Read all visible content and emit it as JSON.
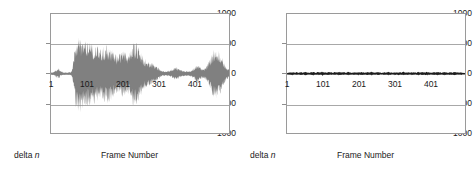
{
  "figure": {
    "background": "#ffffff",
    "waveform_color": "#808080",
    "grid_color": "#a8a8a8",
    "frame_color": "#9a9a9a"
  },
  "chart_data": [
    {
      "type": "area",
      "id": "left-waveform",
      "title": "",
      "xlabel": "Frame Number",
      "ylabel": "delta n",
      "ylabel_prefix": "delta ",
      "ylabel_italic": "n",
      "ylim": [
        -1000,
        1000
      ],
      "xlim": [
        1,
        501
      ],
      "grid": true,
      "legend": "none",
      "yticks": [
        1000,
        500,
        0,
        -500,
        -1000
      ],
      "ytick_labels": [
        "1000",
        "500",
        "0",
        "-500",
        "-1000"
      ],
      "xticks": [
        1,
        101,
        201,
        301,
        401
      ],
      "xtick_labels": [
        "1",
        "101",
        "201",
        "301",
        "401"
      ],
      "description": "Large amplitude delta-n residual signal, envelope peaking near +/-650",
      "envelope_x": [
        1,
        8,
        16,
        22,
        28,
        34,
        40,
        46,
        52,
        58,
        62,
        66,
        70,
        76,
        82,
        88,
        94,
        100,
        106,
        112,
        118,
        124,
        130,
        136,
        142,
        148,
        154,
        160,
        166,
        172,
        178,
        184,
        190,
        196,
        202,
        208,
        214,
        220,
        226,
        232,
        238,
        244,
        250,
        256,
        262,
        268,
        274,
        280,
        286,
        292,
        298,
        304,
        310,
        316,
        322,
        328,
        334,
        340,
        346,
        352,
        358,
        364,
        370,
        376,
        382,
        388,
        394,
        400,
        406,
        412,
        418,
        424,
        430,
        436,
        442,
        448,
        454,
        460,
        466,
        472,
        478,
        484,
        490,
        496,
        501
      ],
      "envelope_upper": [
        20,
        30,
        70,
        95,
        60,
        25,
        20,
        18,
        22,
        30,
        120,
        330,
        520,
        600,
        620,
        570,
        545,
        560,
        530,
        505,
        520,
        500,
        470,
        440,
        430,
        465,
        490,
        510,
        470,
        430,
        380,
        330,
        310,
        360,
        410,
        390,
        350,
        330,
        420,
        520,
        545,
        500,
        420,
        330,
        270,
        230,
        210,
        200,
        185,
        160,
        120,
        90,
        60,
        45,
        40,
        45,
        55,
        70,
        95,
        120,
        100,
        70,
        55,
        45,
        40,
        42,
        55,
        80,
        120,
        155,
        130,
        95,
        80,
        110,
        170,
        260,
        350,
        415,
        430,
        400,
        330,
        240,
        150,
        95,
        60
      ],
      "envelope_lower": [
        -20,
        -28,
        -65,
        -90,
        -55,
        -25,
        -20,
        -18,
        -22,
        -30,
        -130,
        -360,
        -560,
        -640,
        -660,
        -620,
        -590,
        -575,
        -545,
        -520,
        -530,
        -510,
        -480,
        -450,
        -440,
        -480,
        -505,
        -525,
        -490,
        -450,
        -395,
        -345,
        -320,
        -370,
        -420,
        -400,
        -360,
        -340,
        -430,
        -540,
        -565,
        -520,
        -430,
        -340,
        -280,
        -240,
        -215,
        -205,
        -190,
        -165,
        -125,
        -95,
        -62,
        -47,
        -42,
        -47,
        -58,
        -72,
        -98,
        -125,
        -105,
        -72,
        -57,
        -47,
        -42,
        -44,
        -58,
        -84,
        -125,
        -160,
        -135,
        -98,
        -82,
        -115,
        -175,
        -268,
        -360,
        -425,
        -440,
        -410,
        -340,
        -248,
        -155,
        -98,
        -62
      ]
    },
    {
      "type": "area",
      "id": "right-waveform",
      "title": "",
      "xlabel": "Frame Number",
      "ylabel": "delta n",
      "ylabel_prefix": "delta ",
      "ylabel_italic": "n",
      "ylim": [
        -1000,
        1000
      ],
      "xlim": [
        1,
        501
      ],
      "grid": true,
      "legend": "none",
      "yticks": [
        1000,
        500,
        0,
        -500,
        -1000
      ],
      "ytick_labels": [
        "1000",
        "500",
        "0",
        "-500",
        "-1000"
      ],
      "xticks": [
        1,
        101,
        201,
        301,
        401
      ],
      "xtick_labels": [
        "1",
        "101",
        "201",
        "301",
        "401"
      ],
      "description": "Near-zero delta-n residual signal, amplitude within about +/-45",
      "envelope_x": [
        1,
        8,
        16,
        22,
        28,
        34,
        40,
        46,
        52,
        58,
        64,
        70,
        76,
        82,
        88,
        94,
        100,
        106,
        112,
        118,
        124,
        130,
        136,
        142,
        148,
        154,
        160,
        166,
        172,
        178,
        184,
        190,
        196,
        202,
        208,
        214,
        220,
        226,
        232,
        238,
        244,
        250,
        256,
        262,
        268,
        274,
        280,
        286,
        292,
        298,
        304,
        310,
        316,
        322,
        328,
        334,
        340,
        346,
        352,
        358,
        364,
        370,
        376,
        382,
        388,
        394,
        400,
        406,
        412,
        418,
        424,
        430,
        436,
        442,
        448,
        454,
        460,
        466,
        472,
        478,
        484,
        490,
        496,
        501
      ],
      "envelope_upper": [
        10,
        22,
        30,
        18,
        26,
        14,
        30,
        20,
        34,
        22,
        16,
        28,
        36,
        20,
        30,
        22,
        38,
        26,
        18,
        32,
        24,
        16,
        30,
        20,
        34,
        22,
        28,
        18,
        32,
        24,
        14,
        26,
        20,
        34,
        22,
        30,
        16,
        28,
        20,
        36,
        24,
        18,
        30,
        22,
        14,
        26,
        20,
        32,
        24,
        16,
        28,
        18,
        30,
        22,
        34,
        20,
        26,
        16,
        30,
        24,
        18,
        32,
        20,
        28,
        22,
        36,
        24,
        16,
        30,
        20,
        34,
        26,
        18,
        30,
        22,
        16,
        28,
        20,
        32,
        24,
        18,
        26,
        14,
        12
      ],
      "envelope_lower": [
        -12,
        -24,
        -32,
        -20,
        -28,
        -16,
        -32,
        -22,
        -36,
        -24,
        -18,
        -30,
        -38,
        -22,
        -32,
        -24,
        -40,
        -28,
        -20,
        -34,
        -26,
        -18,
        -32,
        -22,
        -36,
        -24,
        -30,
        -20,
        -34,
        -26,
        -16,
        -28,
        -22,
        -36,
        -24,
        -32,
        -18,
        -30,
        -22,
        -38,
        -26,
        -20,
        -32,
        -24,
        -16,
        -28,
        -22,
        -34,
        -26,
        -18,
        -30,
        -20,
        -32,
        -24,
        -36,
        -22,
        -28,
        -18,
        -32,
        -26,
        -20,
        -34,
        -22,
        -30,
        -24,
        -38,
        -26,
        -18,
        -32,
        -22,
        -36,
        -28,
        -20,
        -32,
        -24,
        -18,
        -30,
        -22,
        -34,
        -26,
        -20,
        -28,
        -16,
        -14
      ]
    }
  ]
}
